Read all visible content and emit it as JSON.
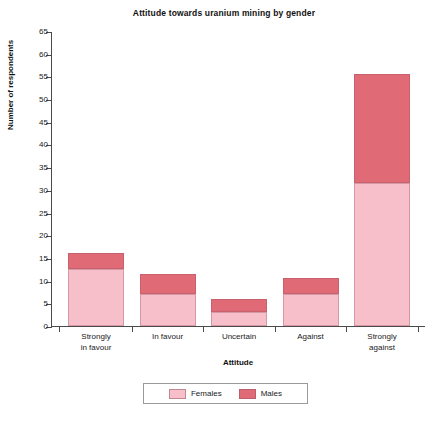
{
  "chart_data": {
    "type": "bar",
    "subtype": "stacked-bar",
    "title": "Attitude towards uranium mining by gender",
    "xlabel": "Attitude",
    "ylabel": "Number of respondents",
    "categories": [
      "Strongly in favour",
      "In favour",
      "Uncertain",
      "Against",
      "Strongly against"
    ],
    "category_lines": [
      [
        "Strongly",
        "in favour"
      ],
      [
        "In favour",
        ""
      ],
      [
        "Uncertain",
        ""
      ],
      [
        "Against",
        ""
      ],
      [
        "Strongly",
        "against"
      ]
    ],
    "series": [
      {
        "name": "Females",
        "color": "#f7bfca",
        "values": [
          12.5,
          7,
          3,
          7,
          31.5
        ]
      },
      {
        "name": "Males",
        "color": "#e06a76",
        "values": [
          3.5,
          4.5,
          3,
          3.5,
          24
        ]
      }
    ],
    "totals": [
      16,
      11.5,
      6,
      10.5,
      55.5
    ],
    "ylim": [
      0,
      65
    ],
    "ytick_step": 5,
    "yticks": [
      0,
      5,
      10,
      15,
      20,
      25,
      30,
      35,
      40,
      45,
      50,
      55,
      60,
      65
    ],
    "grid": false,
    "legend_position": "bottom"
  },
  "legend": {
    "items": [
      {
        "label": "Females",
        "color": "#f7bfca"
      },
      {
        "label": "Males",
        "color": "#e06a76"
      }
    ]
  }
}
